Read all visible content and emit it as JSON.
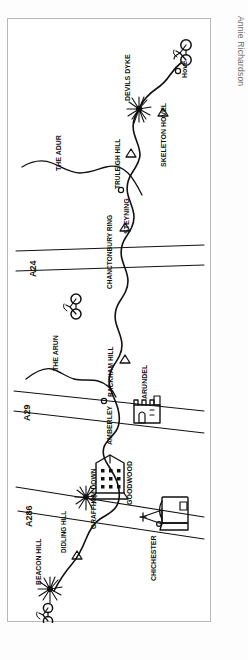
{
  "figure": {
    "type": "hand-drawn-sketch-map",
    "credit": "Annie Richardson",
    "background_color": "#ffffff",
    "ink_color": "#111111",
    "frame_color": "#b8b8b8",
    "orientation_note": "all place labels are drawn rotated 90 degrees"
  },
  "map_labels": {
    "places": [
      {
        "id": "hove",
        "text": "Hove"
      },
      {
        "id": "devils-dyke",
        "text": "DEVILS DYKE"
      },
      {
        "id": "skeleton-hovel",
        "text": "SKELETON HOVEL"
      },
      {
        "id": "truleigh-hill",
        "text": "TRULEIGH HILL"
      },
      {
        "id": "steyning",
        "text": "STEYNING"
      },
      {
        "id": "the-adur",
        "text": "THE ADUR"
      },
      {
        "id": "chanctonbury",
        "text": "CHANCTONBURY RING"
      },
      {
        "id": "the-arun",
        "text": "THE ARUN"
      },
      {
        "id": "rackham-hill",
        "text": "RACKHAM HILL"
      },
      {
        "id": "amberley",
        "text": "AMBERLEY"
      },
      {
        "id": "arundel",
        "text": "ARUNDEL"
      },
      {
        "id": "goodwood",
        "text": "GOODWOOD"
      },
      {
        "id": "graffham-down",
        "text": "GRAFFHAM DOWN"
      },
      {
        "id": "didling-hill",
        "text": "DIDLING HILL"
      },
      {
        "id": "beacon-hill",
        "text": "BEACON HILL"
      },
      {
        "id": "chichester",
        "text": "CHICHESTER"
      }
    ],
    "roads": [
      {
        "id": "a24",
        "text": "A24"
      },
      {
        "id": "a29",
        "text": "A29"
      },
      {
        "id": "a286",
        "text": "A286"
      }
    ]
  },
  "symbols": [
    {
      "id": "cyclist-hove",
      "name": "bicycle-icon",
      "meaning": "cyclist at route end, Hove"
    },
    {
      "id": "cyclist-mid",
      "name": "bicycle-icon",
      "meaning": "cyclist mid route"
    },
    {
      "id": "cyclist-start",
      "name": "bicycle-icon",
      "meaning": "cyclist at route start"
    },
    {
      "id": "hilltop-dyke",
      "name": "starburst-icon",
      "meaning": "viewpoint, Devils Dyke"
    },
    {
      "id": "hilltop-graffham",
      "name": "starburst-icon",
      "meaning": "viewpoint, Graffham Down"
    },
    {
      "id": "hilltop-beacon",
      "name": "starburst-icon",
      "meaning": "viewpoint, Beacon Hill"
    },
    {
      "id": "cathedral",
      "name": "cathedral-icon",
      "meaning": "Chichester Cathedral"
    },
    {
      "id": "castle",
      "name": "castle-icon",
      "meaning": "Arundel Castle"
    },
    {
      "id": "grandstand",
      "name": "grandstand-icon",
      "meaning": "Goodwood racecourse"
    }
  ]
}
